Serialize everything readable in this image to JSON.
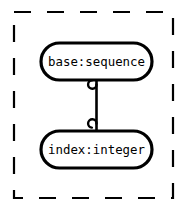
{
  "diagram": {
    "type": "uml-object-diagram",
    "container": {
      "name": "dashed-boundary",
      "style": "dashed",
      "border_color": "#000000",
      "fill_color": "#ffffff"
    },
    "nodes": [
      {
        "id": "base",
        "label": "base:sequence",
        "role": "base",
        "class": "sequence",
        "shape": "stadium",
        "border_color": "#000000",
        "fill_color": "#ffffff",
        "text_color": "#000000"
      },
      {
        "id": "index",
        "label": "index:integer",
        "role": "index",
        "class": "integer",
        "shape": "stadium",
        "border_color": "#000000",
        "fill_color": "#ffffff",
        "text_color": "#000000"
      }
    ],
    "edges": [
      {
        "id": "base-to-index",
        "from": "base",
        "to": "index",
        "source_marker": "hook-loop",
        "target_marker": "hook-loop",
        "line_color": "#000000",
        "style": "solid"
      }
    ]
  }
}
